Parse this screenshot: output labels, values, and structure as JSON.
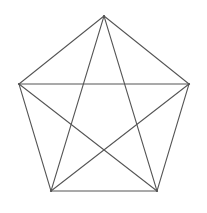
{
  "figure": {
    "name": "complete-graph-k5",
    "background_color": "#ffffff",
    "stroke_color": "#555555",
    "stroke_width": 1.05,
    "width": 207,
    "height": 213,
    "vertex_count": 5,
    "edge_count": 10,
    "vertices": [
      {
        "id": "top",
        "label": "A",
        "x": 104,
        "y": 16
      },
      {
        "id": "upper-right",
        "label": "B",
        "x": 189,
        "y": 84
      },
      {
        "id": "lower-right",
        "label": "C",
        "x": 157,
        "y": 191
      },
      {
        "id": "lower-left",
        "label": "D",
        "x": 51,
        "y": 191
      },
      {
        "id": "upper-left",
        "label": "E",
        "x": 19,
        "y": 84
      }
    ],
    "edges": [
      {
        "id": "edge-top-upper-right",
        "from": 0,
        "to": 1,
        "kind": "pentagon-side"
      },
      {
        "id": "edge-upper-right-lower-right",
        "from": 1,
        "to": 2,
        "kind": "pentagon-side"
      },
      {
        "id": "edge-lower-right-lower-left",
        "from": 2,
        "to": 3,
        "kind": "pentagon-side"
      },
      {
        "id": "edge-lower-left-upper-left",
        "from": 3,
        "to": 4,
        "kind": "pentagon-side"
      },
      {
        "id": "edge-upper-left-top",
        "from": 4,
        "to": 0,
        "kind": "pentagon-side"
      },
      {
        "id": "edge-top-lower-right",
        "from": 0,
        "to": 2,
        "kind": "pentagram-chord"
      },
      {
        "id": "edge-top-lower-left",
        "from": 0,
        "to": 3,
        "kind": "pentagram-chord"
      },
      {
        "id": "edge-upper-right-lower-left",
        "from": 1,
        "to": 3,
        "kind": "pentagram-chord"
      },
      {
        "id": "edge-upper-right-upper-left",
        "from": 1,
        "to": 4,
        "kind": "pentagram-chord"
      },
      {
        "id": "edge-lower-right-upper-left",
        "from": 2,
        "to": 4,
        "kind": "pentagram-chord"
      }
    ]
  }
}
